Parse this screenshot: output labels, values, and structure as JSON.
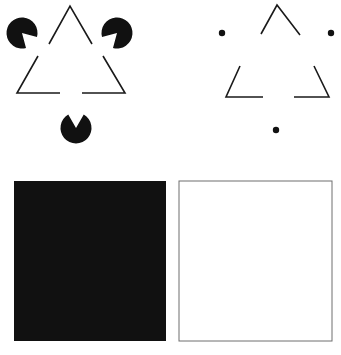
{
  "figure": {
    "title": "Illusory contour demonstration",
    "background_color": "#ffffff",
    "ink_color": "#1a1a1a",
    "width": 341,
    "height": 355,
    "panels": [
      {
        "id": "panel-pacman-triangle",
        "name": "Kanizsa triangle with pac-man inducers",
        "inducer_type": "pacman",
        "inducer_count": 3
      },
      {
        "id": "panel-dot-triangle",
        "name": "Triangle corners with dot inducers",
        "inducer_type": "dot",
        "inducer_count": 3
      },
      {
        "id": "panel-black-square",
        "name": "Solid black square",
        "fill": "#111111",
        "stroke": "none"
      },
      {
        "id": "panel-white-square",
        "name": "Outlined white square",
        "fill": "#ffffff",
        "stroke": "#6e6e6e"
      }
    ]
  },
  "chart_data": {
    "type": "scatter",
    "title": "Illusory contour demonstration",
    "xlabel": "",
    "ylabel": "",
    "xlim": [
      0,
      341
    ],
    "ylim": [
      0,
      355
    ],
    "grid": false,
    "legend": "none",
    "stroke_color": "#1a1a1a",
    "fill_color": "#111111",
    "line_width": 1.6,
    "series": [
      {
        "name": "left-pacman-inducers",
        "type": "pacman",
        "radius": 15.5,
        "values": [
          {
            "label": "top-left-pacman",
            "cx": 22,
            "cy": 33,
            "mouth_center_deg": 45,
            "mouth_width_deg": 60
          },
          {
            "label": "top-right-pacman",
            "cx": 117,
            "cy": 33,
            "mouth_center_deg": 135,
            "mouth_width_deg": 60
          },
          {
            "label": "bottom-pacman",
            "cx": 76,
            "cy": 128,
            "mouth_center_deg": 270,
            "mouth_width_deg": 60
          }
        ]
      },
      {
        "name": "left-triangle-corners",
        "type": "polyline-segments",
        "values": [
          {
            "label": "apex-corner",
            "points": [
              [
                49,
                44
              ],
              [
                70,
                6
              ],
              [
                92,
                44
              ]
            ]
          },
          {
            "label": "bottom-left-corner",
            "points": [
              [
                38,
                56
              ],
              [
                17,
                93
              ],
              [
                60,
                93
              ]
            ]
          },
          {
            "label": "bottom-right-corner",
            "points": [
              [
                103,
                56
              ],
              [
                125,
                93
              ],
              [
                82,
                93
              ]
            ]
          }
        ]
      },
      {
        "name": "right-dot-inducers",
        "type": "dot",
        "radius": 3.2,
        "values": [
          {
            "label": "top-left-dot",
            "cx": 222,
            "cy": 33
          },
          {
            "label": "top-right-dot",
            "cx": 331,
            "cy": 33
          },
          {
            "label": "bottom-dot",
            "cx": 276,
            "cy": 130
          }
        ]
      },
      {
        "name": "right-triangle-corners",
        "type": "polyline-segments",
        "values": [
          {
            "label": "apex-corner",
            "points": [
              [
                261,
                34
              ],
              [
                277,
                5
              ],
              [
                300,
                35
              ]
            ]
          },
          {
            "label": "bottom-left-corner",
            "points": [
              [
                240,
                66
              ],
              [
                226,
                97
              ],
              [
                263,
                97
              ]
            ]
          },
          {
            "label": "bottom-right-corner",
            "points": [
              [
                314,
                66
              ],
              [
                329,
                97
              ],
              [
                294,
                97
              ]
            ]
          }
        ]
      },
      {
        "name": "squares",
        "type": "rect",
        "values": [
          {
            "label": "black-square",
            "x": 14,
            "y": 181,
            "w": 152,
            "h": 160,
            "fill": "#111111",
            "stroke": "none"
          },
          {
            "label": "white-square",
            "x": 179,
            "y": 181,
            "w": 153,
            "h": 160,
            "fill": "#ffffff",
            "stroke": "#6e6e6e"
          }
        ]
      }
    ]
  }
}
